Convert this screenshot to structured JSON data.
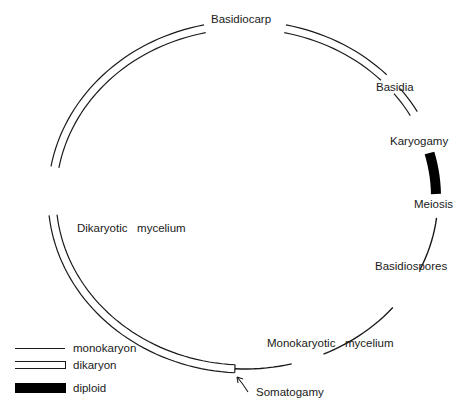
{
  "diagram": {
    "ellipse": {
      "cx": 245,
      "cy": 197,
      "rx": 197,
      "ry": 176,
      "dikaryon_gap": 8
    },
    "colors": {
      "line": "#1a1a1a",
      "background": "#ffffff",
      "diploid": "#000000"
    },
    "segments": {
      "dikaryon": [
        [
          93,
          174
        ],
        [
          190,
          258
        ],
        [
          282,
          316
        ],
        [
          322,
          331
        ]
      ],
      "diploid": [
        [
          345,
          359
        ]
      ],
      "monokaryon": [
        [
          7,
          25
        ],
        [
          40,
          66
        ],
        [
          76,
          93
        ]
      ]
    },
    "labels": {
      "basidiocarp": "Basidiocarp",
      "basidia": "Basidia",
      "karyogamy": "Karyogamy",
      "meiosis": "Meiosis",
      "basidiospores": "Basidiospores",
      "monokaryotic_mycelium": "Monokaryotic   mycelium",
      "somatogamy": "Somatogamy",
      "dikaryotic_mycelium": "Dikaryotic   mycelium"
    }
  },
  "legend": {
    "items": [
      {
        "key": "monokaryon",
        "label": "monokaryon"
      },
      {
        "key": "dikaryon",
        "label": "dikaryon"
      },
      {
        "key": "diploid",
        "label": "diploid"
      }
    ]
  }
}
